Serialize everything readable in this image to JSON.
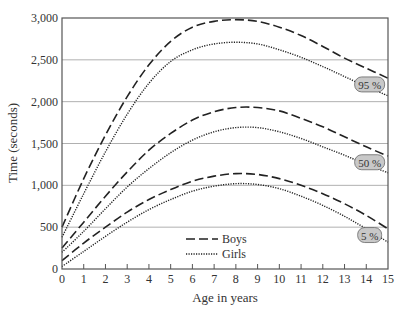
{
  "chart_data": {
    "type": "line",
    "title": "",
    "xlabel": "Age in years",
    "ylabel": "Time (seconds)",
    "xlim": [
      0,
      15
    ],
    "ylim": [
      0,
      3000
    ],
    "x_ticks": [
      0,
      1,
      2,
      3,
      4,
      5,
      6,
      7,
      8,
      9,
      10,
      11,
      12,
      13,
      14,
      15
    ],
    "y_ticks": [
      0,
      500,
      1000,
      1500,
      2000,
      2500,
      3000
    ],
    "y_tick_labels": [
      "0",
      "500",
      "1,000",
      "1,500",
      "2,000",
      "2,500",
      "3,000"
    ],
    "grid": "horizontal",
    "legend": {
      "position": "lower-center",
      "entries": [
        {
          "label": "Boys",
          "style": "dashed"
        },
        {
          "label": "Girls",
          "style": "dotted"
        }
      ]
    },
    "annotations": [
      {
        "text": "95 %",
        "x": 14.8,
        "y": 2200
      },
      {
        "text": "50 %",
        "x": 14.8,
        "y": 1270
      },
      {
        "text": "5 %",
        "x": 14.8,
        "y": 400
      }
    ],
    "x": [
      0,
      1,
      2,
      3,
      4,
      5,
      6,
      7,
      8,
      9,
      10,
      11,
      12,
      13,
      14,
      15
    ],
    "series": [
      {
        "name": "Boys 95%",
        "group": "Boys",
        "percentile": "95 %",
        "style": "dashed",
        "values": [
          500,
          1080,
          1600,
          2060,
          2440,
          2720,
          2890,
          2960,
          2980,
          2960,
          2890,
          2790,
          2660,
          2520,
          2400,
          2280
        ]
      },
      {
        "name": "Girls 95%",
        "group": "Girls",
        "percentile": "95 %",
        "style": "dotted",
        "values": [
          380,
          900,
          1400,
          1850,
          2220,
          2480,
          2620,
          2690,
          2710,
          2690,
          2620,
          2530,
          2420,
          2300,
          2180,
          2070
        ]
      },
      {
        "name": "Boys 50%",
        "group": "Boys",
        "percentile": "50 %",
        "style": "dashed",
        "values": [
          250,
          560,
          870,
          1160,
          1420,
          1620,
          1780,
          1880,
          1930,
          1930,
          1890,
          1800,
          1700,
          1580,
          1460,
          1350
        ]
      },
      {
        "name": "Girls 50%",
        "group": "Girls",
        "percentile": "50 %",
        "style": "dotted",
        "values": [
          200,
          450,
          720,
          980,
          1200,
          1390,
          1540,
          1640,
          1690,
          1690,
          1640,
          1560,
          1460,
          1360,
          1250,
          1150
        ]
      },
      {
        "name": "Boys 5%",
        "group": "Boys",
        "percentile": "5 %",
        "style": "dashed",
        "values": [
          100,
          310,
          500,
          680,
          830,
          950,
          1050,
          1110,
          1140,
          1130,
          1080,
          1000,
          900,
          780,
          640,
          480
        ]
      },
      {
        "name": "Girls 5%",
        "group": "Girls",
        "percentile": "5 %",
        "style": "dotted",
        "values": [
          30,
          210,
          390,
          560,
          710,
          830,
          930,
          990,
          1020,
          1010,
          960,
          870,
          760,
          630,
          480,
          320
        ]
      }
    ]
  },
  "colors": {
    "axis": "#555555",
    "grid": "#b0b0b0",
    "line": "#222222",
    "label_bg": "#c8c8c8",
    "label_border": "#666666"
  }
}
